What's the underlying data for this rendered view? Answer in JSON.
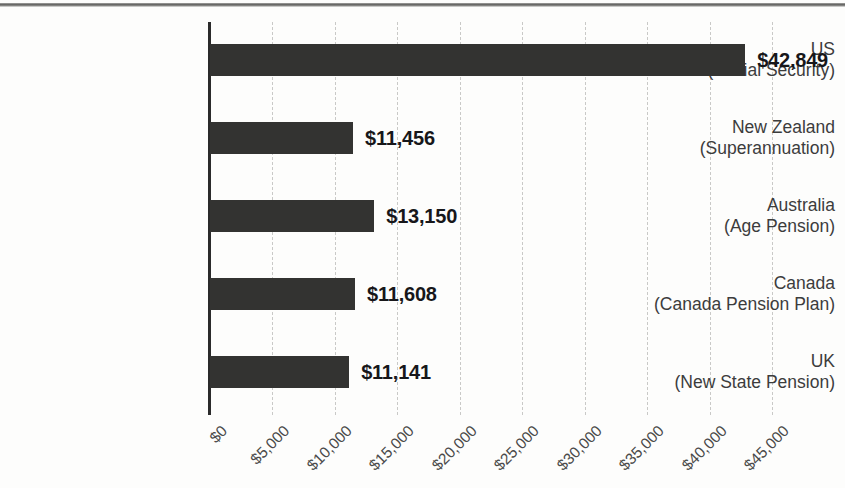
{
  "chart_data": {
    "type": "bar",
    "orientation": "horizontal",
    "title": "",
    "xlabel": "",
    "ylabel": "",
    "categories": [
      "US\n(Social Security)",
      "New Zealand\n(Superannuation)",
      "Australia\n(Age Pension)",
      "Canada\n(Canada Pension Plan)",
      "UK\n(New State Pension)"
    ],
    "category_lines": [
      {
        "country": "US",
        "program": "(Social Security)"
      },
      {
        "country": "New Zealand",
        "program": "(Superannuation)"
      },
      {
        "country": "Australia",
        "program": "(Age Pension)"
      },
      {
        "country": "Canada",
        "program": "(Canada Pension Plan)"
      },
      {
        "country": "UK",
        "program": "(New State Pension)"
      }
    ],
    "values": [
      42849,
      11456,
      13150,
      11608,
      11141
    ],
    "value_labels": [
      "$42,849",
      "$11,456",
      "$13,150",
      "$11,608",
      "$11,141"
    ],
    "xlim": [
      0,
      45000
    ],
    "xticks": [
      0,
      5000,
      10000,
      15000,
      20000,
      25000,
      30000,
      35000,
      40000,
      45000
    ],
    "xtick_labels": [
      "$0",
      "$5,000",
      "$10,000",
      "$15,000",
      "$20,000",
      "$25,000",
      "$30,000",
      "$35,000",
      "$40,000",
      "$45,000"
    ],
    "grid": true,
    "grid_axis": "x",
    "grid_style": "dashed",
    "legend": false,
    "bar_color": "#333331",
    "grid_color": "#c9c9c7",
    "axis_color": "#2b2b2b",
    "label_color": "#3c3c3c",
    "value_label_color": "#17171a"
  }
}
